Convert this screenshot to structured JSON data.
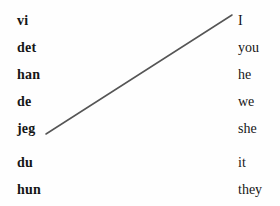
{
  "exercise": {
    "type": "matching-pairs",
    "background_color": "#fefefe",
    "text_color": "#161616",
    "row_spacing_px": 27,
    "source_column": {
      "name": "norwegian-pronouns",
      "x_px": 17,
      "items": [
        {
          "label": "vi",
          "y_px": 7
        },
        {
          "label": "det",
          "y_px": 34
        },
        {
          "label": "han",
          "y_px": 61
        },
        {
          "label": "de",
          "y_px": 88
        },
        {
          "label": "jeg",
          "y_px": 115
        },
        {
          "label": "du",
          "y_px": 149
        },
        {
          "label": "hun",
          "y_px": 176
        }
      ]
    },
    "target_column": {
      "name": "english-pronouns",
      "x_px": 238,
      "items": [
        {
          "label": "I",
          "y_px": 7
        },
        {
          "label": "you",
          "y_px": 34
        },
        {
          "label": "he",
          "y_px": 61
        },
        {
          "label": "we",
          "y_px": 88
        },
        {
          "label": "she",
          "y_px": 115
        },
        {
          "label": "it",
          "y_px": 149
        },
        {
          "label": "they",
          "y_px": 176
        }
      ]
    },
    "connections": [
      {
        "from_label": "jeg",
        "to_label": "I",
        "x1": 46,
        "y1": 134,
        "x2": 232,
        "y2": 15,
        "color": "#555555",
        "width": 1.5
      }
    ]
  }
}
